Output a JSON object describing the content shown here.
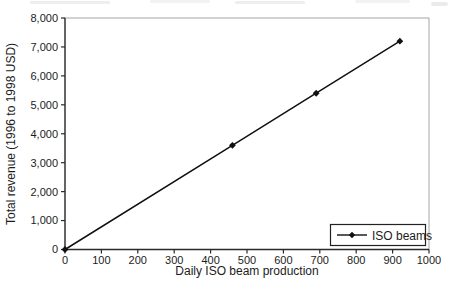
{
  "figure": {
    "background": "#ffffff"
  },
  "chart_data": {
    "type": "line",
    "title": "",
    "xlabel": "Daily ISO beam production",
    "ylabel": "Total revenue (1996 to 1998 USD)",
    "xlim": [
      0,
      1000
    ],
    "ylim": [
      0,
      8000
    ],
    "grid": false,
    "legend": {
      "position": "inside-bottom-right",
      "entries": [
        "ISO beams"
      ]
    },
    "xticks": [
      {
        "value": 0,
        "label": "0"
      },
      {
        "value": 100,
        "label": "100"
      },
      {
        "value": 200,
        "label": "200"
      },
      {
        "value": 300,
        "label": "300"
      },
      {
        "value": 400,
        "label": "400"
      },
      {
        "value": 500,
        "label": "500"
      },
      {
        "value": 600,
        "label": "600"
      },
      {
        "value": 700,
        "label": "700"
      },
      {
        "value": 800,
        "label": "800"
      },
      {
        "value": 900,
        "label": "900"
      },
      {
        "value": 1000,
        "label": "1000"
      }
    ],
    "yticks": [
      {
        "value": 0,
        "label": "0"
      },
      {
        "value": 1000,
        "label": "1,000"
      },
      {
        "value": 2000,
        "label": "2,000"
      },
      {
        "value": 3000,
        "label": "3,000"
      },
      {
        "value": 4000,
        "label": "4,000"
      },
      {
        "value": 5000,
        "label": "5,000"
      },
      {
        "value": 6000,
        "label": "6,000"
      },
      {
        "value": 7000,
        "label": "7,000"
      },
      {
        "value": 8000,
        "label": "8,000"
      }
    ],
    "series": [
      {
        "name": "ISO beams",
        "marker": "diamond",
        "points": [
          [
            0,
            0
          ],
          [
            460,
            3600
          ],
          [
            690,
            5400
          ],
          [
            920,
            7200
          ]
        ]
      }
    ],
    "colors": {
      "line": "#111111",
      "axis": "#2a2a2a",
      "plot_border": "#a6a6a6",
      "text": "#1c1c1c",
      "legend_border": "#222222"
    }
  }
}
